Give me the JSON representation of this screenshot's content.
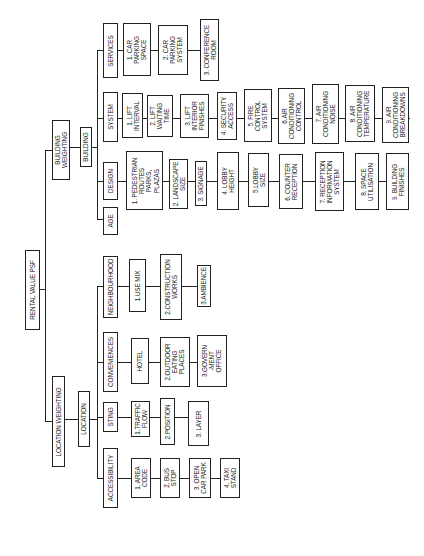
{
  "diagram": {
    "orientation": "rotated 90 degrees counter-clockwise",
    "root": "RENTAL VALUE PSF",
    "branches": {
      "building_weighting": "BUILDING\nWEIGHTING",
      "building": "BUILDING",
      "location_weighting": "LOCATION WEIGHTING",
      "location": "LOCATION"
    },
    "building_groups": {
      "services": {
        "label": "SERVICES",
        "items": [
          "1. CAR\nPARKING\nSPACE",
          "2. CAR\nPARKING\nSYSTEM",
          "3. CONFERENCE\nROOM"
        ]
      },
      "system": {
        "label": "SYSTEM",
        "items": [
          "1. LIFT\nINTERVAL",
          "2. LIFT\nWAITING\nTIME",
          "3. LIFT\nINTERIOR\nFINISHES",
          "4. SECURITY\nACCESS",
          "5. FIRE\nCONTROL\nSYSTEM",
          "6.AIR\nCONDITIONING\nCONTROL",
          "7. AIR\nCONDITIONING\nNOISE",
          "8. AIR\nCONDITIONING\nTEMPERATURE",
          "9. AIR\nCONDITIONING\nBREAKDOWNS"
        ]
      },
      "design": {
        "label": "DESIGN",
        "items": [
          "1. PEDESTRIAN\nROUTES\nPARKS,\nPLAZAS",
          "2. LANDSCAPE\nSIZE",
          "3. SIGNAGE",
          "4. LOBBY\nHEIGHT",
          "5.LOBBY\nSIZE",
          "6. COUNTER\nRECEPTION",
          "7. RECEPTION\nINFORMATION\nSYSTEM",
          "8. SPACE\nUTILISATION",
          "9. BUILDING\nFINISHES"
        ]
      },
      "age": {
        "label": "AGE",
        "items": []
      }
    },
    "location_groups": {
      "neighbourhood": {
        "label": "NEIGHBOURHOOD",
        "items": [
          "1.USE MIX",
          "2.CONSTRUCTION\nWORKS",
          "3.AMBIENCE"
        ]
      },
      "conveniences": {
        "label": "CONVENIENCES",
        "items": [
          "HOTEL",
          "2.OUTDOOR\nEATING\nPLACES",
          "3.GOVERN\n-MENT\nOFFICE"
        ]
      },
      "sting": {
        "label": "STING",
        "items": [
          "1.TRAFFIC\nFLOW",
          "2.POSITION",
          "3. LAYER"
        ]
      },
      "accessibility": {
        "label": "ACCESSIBILITY",
        "items": [
          "1. AREA\nCODE",
          "2. BUS\nSTOP",
          "3. OPEN\nCAR PARK",
          "4. TAXI\nSTAND"
        ]
      }
    },
    "colors": {
      "line": "#222222",
      "background": "#ffffff",
      "text": "#1a1a1a"
    }
  }
}
